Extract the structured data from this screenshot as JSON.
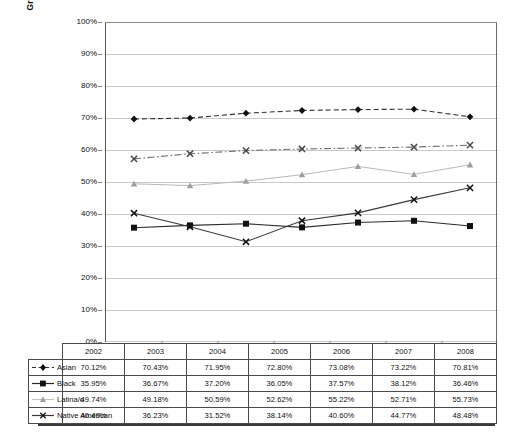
{
  "chart_data": {
    "type": "line",
    "title": "",
    "xlabel": "",
    "ylabel": "Graduation Rate Within 150% of Normal Time",
    "ylim": [
      0,
      100
    ],
    "yticks": [
      "0%",
      "10%",
      "20%",
      "30%",
      "40%",
      "50%",
      "60%",
      "70%",
      "80%",
      "90%",
      "100%"
    ],
    "grid": true,
    "legend_position": "table-left",
    "categories": [
      "2002",
      "2003",
      "2004",
      "2005",
      "2006",
      "2007",
      "2008"
    ],
    "series": [
      {
        "name": "Asian",
        "marker": "diamond",
        "line_style": "dashed",
        "color": "#333333",
        "values": [
          70.12,
          70.43,
          71.95,
          72.8,
          73.08,
          73.22,
          70.81
        ],
        "labels": [
          "70.12%",
          "70.43%",
          "71.95%",
          "72.80%",
          "73.08%",
          "73.22%",
          "70.81%"
        ]
      },
      {
        "name": "Black",
        "marker": "square",
        "line_style": "solid",
        "color": "#2b2b2b",
        "values": [
          35.95,
          36.67,
          37.2,
          36.05,
          37.57,
          38.12,
          36.46
        ],
        "labels": [
          "35.95%",
          "36.67%",
          "37.20%",
          "36.05%",
          "37.57%",
          "38.12%",
          "36.46%"
        ]
      },
      {
        "name": "Latina/o",
        "marker": "triangle",
        "line_style": "solid",
        "color": "#b9b9b9",
        "values": [
          49.74,
          49.18,
          50.59,
          52.62,
          55.22,
          52.71,
          55.73
        ],
        "labels": [
          "49.74%",
          "49.18%",
          "50.59%",
          "52.62%",
          "55.22%",
          "52.71%",
          "55.73%"
        ]
      },
      {
        "name": "Native American",
        "marker": "x",
        "line_style": "solid",
        "color": "#3a3a3a",
        "values": [
          40.49,
          36.23,
          31.52,
          38.14,
          40.6,
          44.77,
          48.48
        ],
        "labels": [
          "40.49%",
          "36.23%",
          "31.52%",
          "38.14%",
          "40.60%",
          "44.77%",
          "48.48%"
        ]
      },
      {
        "name": "",
        "marker": "x",
        "line_style": "dash-dot",
        "color": "#707070",
        "values": [
          57.6,
          59.2,
          60.2,
          60.7,
          61.0,
          61.3,
          61.9
        ],
        "labels": [
          "",
          "",
          "",
          "",
          "",
          "",
          ""
        ]
      }
    ]
  },
  "axis": {
    "ylabel": "Graduation Rate Within 150% of Normal Time",
    "ytick_0": "0%",
    "ytick_10": "10%",
    "ytick_20": "20%",
    "ytick_30": "30%",
    "ytick_40": "40%",
    "ytick_50": "50%",
    "ytick_60": "60%",
    "ytick_70": "70%",
    "ytick_80": "80%",
    "ytick_90": "90%",
    "ytick_100": "100%"
  },
  "table": {
    "corner": "",
    "years": [
      "2002",
      "2003",
      "2004",
      "2005",
      "2006",
      "2007",
      "2008"
    ],
    "rows": [
      {
        "label": "Asian",
        "key": "dashed-diamond-key",
        "values": [
          "70.12%",
          "70.43%",
          "71.95%",
          "72.80%",
          "73.08%",
          "73.22%",
          "70.81%"
        ]
      },
      {
        "label": "Black",
        "key": "solid-square-key",
        "values": [
          "35.95%",
          "36.67%",
          "37.20%",
          "36.05%",
          "37.57%",
          "38.12%",
          "36.46%"
        ]
      },
      {
        "label": "Latina/o",
        "key": "light-triangle-key",
        "values": [
          "49.74%",
          "49.18%",
          "50.59%",
          "52.62%",
          "55.22%",
          "52.71%",
          "55.73%"
        ]
      },
      {
        "label": "Native American",
        "key": "solid-x-key",
        "values": [
          "40.49%",
          "36.23%",
          "31.52%",
          "38.14%",
          "40.60%",
          "44.77%",
          "48.48%"
        ]
      }
    ]
  }
}
